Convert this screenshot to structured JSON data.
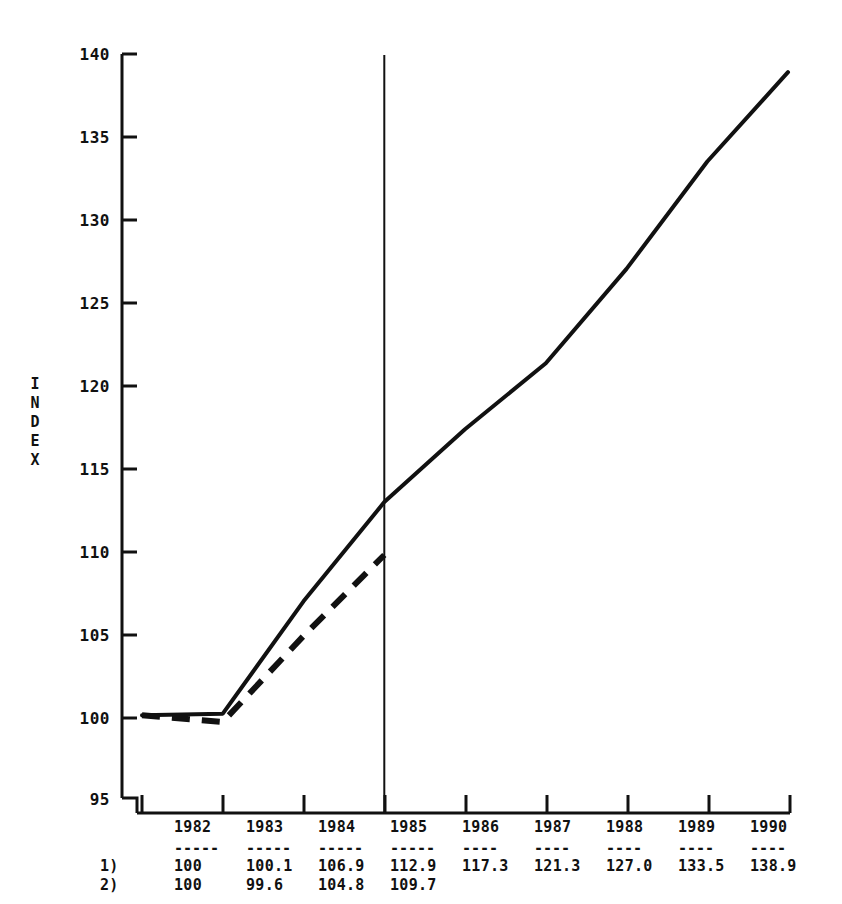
{
  "chart_data": {
    "type": "line",
    "title": "",
    "xlabel": "",
    "ylabel": "INDEX",
    "ylim": [
      95,
      140
    ],
    "xlim": [
      1982,
      1990
    ],
    "grid": false,
    "legend_position": "none",
    "y_ticks": [
      140,
      135,
      130,
      125,
      120,
      115,
      110,
      105,
      100,
      95
    ],
    "x_ticks": [
      1982,
      1983,
      1984,
      1985,
      1986,
      1987,
      1988,
      1989,
      1990
    ],
    "categories": [
      "1982",
      "1983",
      "1984",
      "1985",
      "1986",
      "1987",
      "1988",
      "1989",
      "1990"
    ],
    "annotations": [
      {
        "name": "forecast-divider",
        "type": "vline",
        "x": 1985,
        "style": "solid"
      }
    ],
    "series": [
      {
        "name": "1)",
        "style": "solid",
        "x": [
          1982,
          1983,
          1984,
          1985,
          1986,
          1987,
          1988,
          1989,
          1990
        ],
        "values": [
          100,
          100.1,
          106.9,
          112.9,
          117.3,
          121.3,
          127.0,
          133.5,
          138.9
        ],
        "labels": [
          "100",
          "100.1",
          "106.9",
          "112.9",
          "117.3",
          "121.3",
          "127.0",
          "133.5",
          "138.9"
        ]
      },
      {
        "name": "2)",
        "style": "dashed",
        "x": [
          1982,
          1983,
          1984,
          1985
        ],
        "values": [
          100,
          99.6,
          104.8,
          109.7
        ],
        "labels": [
          "100",
          "99.6",
          "104.8",
          "109.7"
        ]
      }
    ]
  },
  "axis": {
    "y_title_letters": [
      "I",
      "N",
      "D",
      "E",
      "X"
    ],
    "y_tick_labels": [
      "140",
      "135",
      "130",
      "125",
      "120",
      "115",
      "110",
      "105",
      "100",
      "95"
    ]
  },
  "table": {
    "rule": "-----",
    "rule_short": "----",
    "header_years": [
      "1982",
      "1983",
      "1984",
      "1985",
      "1986",
      "1987",
      "1988",
      "1989",
      "1990"
    ],
    "rows": [
      {
        "label": "1)",
        "cells": [
          "100",
          "100.1",
          "106.9",
          "112.9",
          "117.3",
          "121.3",
          "127.0",
          "133.5",
          "138.9"
        ]
      },
      {
        "label": "2)",
        "cells": [
          "100",
          "99.6",
          "104.8",
          "109.7",
          "",
          "",
          "",
          "",
          ""
        ]
      }
    ]
  },
  "colors": {
    "ink": "#111111",
    "background": "#ffffff"
  }
}
